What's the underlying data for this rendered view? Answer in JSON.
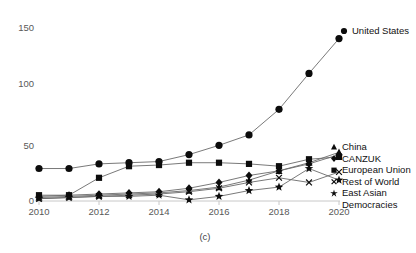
{
  "chart_data": {
    "type": "line",
    "title": "",
    "subtitle": "(c)",
    "xlabel": "",
    "ylabel": "",
    "xlim": [
      2010,
      2020
    ],
    "ylim": [
      0,
      150
    ],
    "x": [
      2010,
      2011,
      2012,
      2013,
      2014,
      2015,
      2016,
      2017,
      2018,
      2019,
      2020
    ],
    "xticks": [
      2010,
      2012,
      2014,
      2016,
      2018,
      2020
    ],
    "xtick_labels": [
      "2010",
      "2012",
      "2014",
      "2016",
      "2018",
      "2020"
    ],
    "yticks": [
      0,
      50,
      100,
      150
    ],
    "ytick_labels": [
      "0",
      "50",
      "100",
      "150"
    ],
    "grid": false,
    "legend_position": "right",
    "series": [
      {
        "name": "United States",
        "marker": "circle",
        "values": [
          28,
          28,
          32,
          33,
          34,
          40,
          48,
          57,
          79,
          110,
          140
        ]
      },
      {
        "name": "China",
        "marker": "triangle",
        "values": [
          3,
          4,
          5,
          6,
          7,
          9,
          12,
          18,
          26,
          33,
          42
        ]
      },
      {
        "name": "CANZUK",
        "marker": "diamond",
        "values": [
          4,
          5,
          6,
          7,
          8,
          11,
          16,
          22,
          26,
          32,
          40
        ]
      },
      {
        "name": "European Union",
        "marker": "square",
        "values": [
          5,
          5,
          20,
          30,
          31,
          33,
          33,
          32,
          30,
          36,
          38
        ]
      },
      {
        "name": "Rest of World",
        "marker": "cross",
        "values": [
          2,
          3,
          4,
          5,
          6,
          8,
          11,
          16,
          20,
          16,
          25
        ]
      },
      {
        "name": "East Asian Democracies",
        "marker": "star",
        "values": [
          2,
          3,
          4,
          4,
          5,
          1,
          4,
          9,
          12,
          28,
          18
        ]
      }
    ]
  },
  "legend": {
    "top": [
      {
        "label": "United States",
        "marker": "circle"
      }
    ],
    "bottom": [
      {
        "label": "China",
        "marker": "triangle"
      },
      {
        "label": "CANZUK",
        "marker": "diamond"
      },
      {
        "label": "European Union",
        "marker": "square"
      },
      {
        "label": "Rest of World",
        "marker": "cross"
      },
      {
        "label": "East Asian",
        "marker": "star"
      },
      {
        "label": "Democracies",
        "marker": "none"
      }
    ]
  },
  "axis": {
    "y_labels": [
      "150",
      "100",
      "50",
      "0"
    ],
    "x_labels": [
      "2010",
      "2012",
      "2014",
      "2016",
      "2018",
      "2020"
    ],
    "caption": "(c)"
  }
}
